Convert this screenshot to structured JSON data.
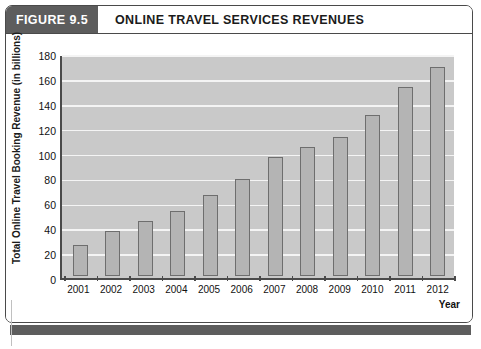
{
  "figure": {
    "tag": "FIGURE 9.5",
    "title": "ONLINE TRAVEL SERVICES REVENUES"
  },
  "colors": {
    "tag_background": "#5d5d5d",
    "frame_border": "#4a4a4a",
    "plot_background": "#c9c9c9",
    "gridline": "#f4f4f4",
    "bar_fill": "#b4b4b4",
    "bar_border": "#6e6e6e",
    "footer_band": "#5d5d5d"
  },
  "chart_data": {
    "type": "bar",
    "title": "ONLINE TRAVEL SERVICES REVENUES",
    "xlabel": "Year",
    "ylabel": "Total Online Travel Booking Revenue (in billions)",
    "categories": [
      "2001",
      "2002",
      "2003",
      "2004",
      "2005",
      "2006",
      "2007",
      "2008",
      "2009",
      "2010",
      "2011",
      "2012"
    ],
    "values": [
      25,
      36,
      44,
      52,
      65,
      78,
      96,
      104,
      112,
      129,
      152,
      168
    ],
    "ylim": [
      0,
      180
    ],
    "yticks": [
      0,
      20,
      40,
      60,
      80,
      100,
      120,
      140,
      160,
      180
    ],
    "ytick_labels": [
      "0",
      "20",
      "40",
      "60",
      "80",
      "100",
      "120",
      "140",
      "160",
      "180"
    ],
    "grid": true,
    "legend": null
  }
}
